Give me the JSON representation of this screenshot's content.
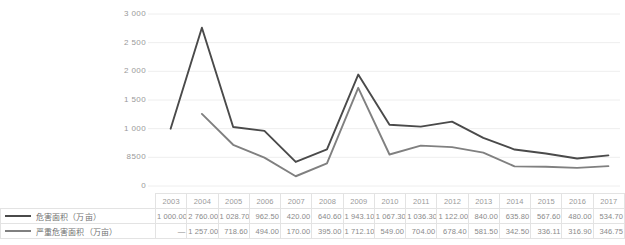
{
  "chart_data": {
    "type": "line",
    "title": "",
    "xlabel": "",
    "ylabel": "",
    "ylim": [
      0,
      3000
    ],
    "yticks": [
      0,
      500,
      1000,
      1500,
      2000,
      2500,
      3000
    ],
    "ytick_labels": [
      "0",
      "8500",
      "1 000",
      "1 500",
      "2 000",
      "2 500",
      "3 000"
    ],
    "grid": true,
    "legend_position": "bottom-left",
    "categories": [
      "2003",
      "2004",
      "2005",
      "2006",
      "2007",
      "2008",
      "2009",
      "2010",
      "2011",
      "2012",
      "2013",
      "2014",
      "2015",
      "2016",
      "2017"
    ],
    "series": [
      {
        "name": "危害面积（万亩）",
        "color": "#4a4a4a",
        "values": [
          1000.0,
          2760.0,
          1028.7,
          962.5,
          420.0,
          640.6,
          1943.1,
          1067.3,
          1036.3,
          1122.0,
          840.0,
          635.8,
          567.6,
          480.0,
          534.7
        ],
        "labels": [
          "1 000.00",
          "2 760.00",
          "1 028.70",
          "962.50",
          "420.00",
          "640.60",
          "1 943.10",
          "1 067.30",
          "1 036.30",
          "1 122.00",
          "840.00",
          "635.80",
          "567.60",
          "480.00",
          "534.70"
        ]
      },
      {
        "name": "严重危害面积（万亩）",
        "color": "#808080",
        "values": [
          null,
          1257.0,
          718.6,
          494.0,
          170.0,
          395.0,
          1712.1,
          549.0,
          704.0,
          678.4,
          581.5,
          342.5,
          336.11,
          316.9,
          346.75
        ],
        "labels": [
          "—",
          "1 257.00",
          "718.60",
          "494.00",
          "170.00",
          "395.00",
          "1 712.10",
          "549.00",
          "704.00",
          "678.40",
          "581.50",
          "342.50",
          "336.11",
          "316.90",
          "346.75"
        ]
      }
    ]
  }
}
